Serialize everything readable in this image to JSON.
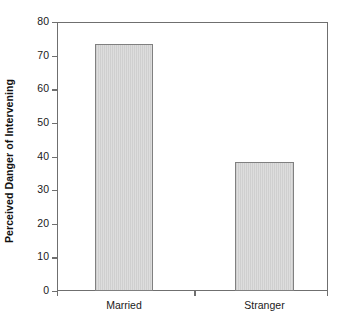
{
  "chart_data": {
    "type": "bar",
    "title": "",
    "xlabel": "",
    "ylabel": "Perceived Danger of Intervening",
    "categories": [
      "Married",
      "Stranger"
    ],
    "values": [
      73.5,
      38.5
    ],
    "ylim": [
      0,
      80
    ],
    "ytick_labels": [
      "0",
      "10",
      "20",
      "30",
      "40",
      "50",
      "60",
      "70",
      "80"
    ],
    "ytick_values": [
      0,
      10,
      20,
      30,
      40,
      50,
      60,
      70,
      80
    ],
    "grid": false,
    "legend": false,
    "bar_fill_color": "#d6d6d6",
    "bar_border_color": "#808080",
    "axis_color": "#6f6f6f",
    "text_color": "#1a1a1a"
  }
}
